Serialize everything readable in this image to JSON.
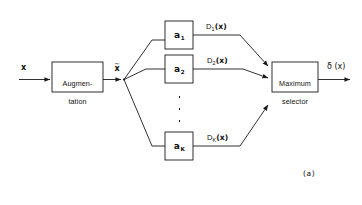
{
  "figure": {
    "caption": "(a)",
    "input_label": "x",
    "intermediate_label": "x",
    "intermediate_tilde": "~",
    "output_label": "δ (x)",
    "stroke_color": "#1a1a1a",
    "background_color": "#ffffff"
  },
  "blocks": {
    "augmentation": {
      "line1": "Augmen-",
      "line2": "tation"
    },
    "selector": {
      "line1": "Maximum",
      "line2": "selector"
    }
  },
  "branches": [
    {
      "box_symbol": "a",
      "box_subscript": "1",
      "signal_name": "D",
      "signal_subscript": "1",
      "signal_arg": "(x)"
    },
    {
      "box_symbol": "a",
      "box_subscript": "2",
      "signal_name": "D",
      "signal_subscript": "2",
      "signal_arg": "(x)"
    },
    {
      "box_symbol": "a",
      "box_subscript": "K",
      "signal_name": "D",
      "signal_subscript": "K",
      "signal_arg": "(x)"
    }
  ],
  "ellipsis": {
    "dots": "⋮"
  }
}
